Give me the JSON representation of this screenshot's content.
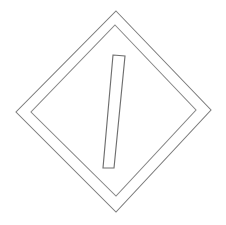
{
  "image": {
    "title": "Diamond hazard placard outline",
    "description": "Black-and-white line drawing of a diamond-shaped placard with a double border and a single slanted vertical bar centered inside",
    "width": 226,
    "height": 225,
    "background_color": "#ffffff",
    "line_color": "#7b7b7b",
    "style": "thin single-weight outline, no fill, no text"
  },
  "shapes": {
    "outer_diamond": {
      "name": "outer-diamond",
      "points": "116,11 211,110 116,212 16,112",
      "stroke": "#7b7b7b",
      "fill": "none"
    },
    "inner_diamond": {
      "name": "inner-diamond",
      "points": "115,25 196,110 116,196 31,112",
      "stroke": "#868686",
      "fill": "none"
    },
    "center_bar": {
      "name": "center-bar",
      "points": "113,55 125,56 114,168 103,168",
      "stroke": "#6f6f6f",
      "fill": "none"
    }
  }
}
